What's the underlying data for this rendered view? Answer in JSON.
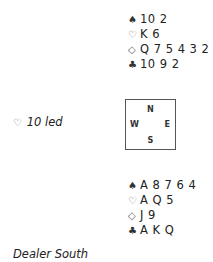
{
  "north": {
    "spades": "10 2",
    "hearts": "K 6",
    "diamonds": "Q 7 5 4 3 2",
    "clubs": "10 9 2"
  },
  "south": {
    "spades": "A 8 7 6 4",
    "hearts": "A Q 5",
    "diamonds": "J 9",
    "clubs": "A K Q"
  },
  "suits": {
    "spades": "♠",
    "hearts": "♡",
    "diamonds": "◇",
    "clubs": "♣"
  },
  "lead": {
    "suit": "♡",
    "text": "10 led"
  },
  "compass": {
    "n": "N",
    "e": "E",
    "s": "S",
    "w": "W"
  },
  "dealer": "Dealer South"
}
